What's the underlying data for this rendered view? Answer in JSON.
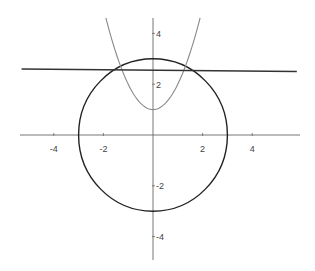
{
  "chart_data": {
    "type": "line",
    "title": "",
    "xlabel": "",
    "ylabel": "",
    "xlim": [
      -6,
      6
    ],
    "ylim": [
      -5,
      5
    ],
    "grid": false,
    "legend": "none",
    "x_ticks": [
      -4,
      -2,
      2,
      4
    ],
    "x_tick_labels": [
      "-4",
      "-2",
      "2",
      "4"
    ],
    "y_ticks": [
      4,
      2,
      -2,
      -4
    ],
    "y_tick_labels": [
      "4",
      "2",
      "-2",
      "-4"
    ],
    "series": [
      {
        "name": "circle",
        "kind": "circle",
        "equation": "x^2 + y^2 = 9",
        "center": [
          0,
          0
        ],
        "radius": 3,
        "color": "#222222"
      },
      {
        "name": "parabola",
        "kind": "function",
        "equation": "y = x^2 + 1",
        "coefficients": {
          "a": 1,
          "b": 0,
          "c": 1
        },
        "x_range": [
          -1.9,
          1.9
        ],
        "color": "#888888"
      },
      {
        "name": "horizontal-line",
        "kind": "line",
        "equation": "y = 2.55",
        "points": [
          [
            -5.3,
            2.6
          ],
          [
            5.8,
            2.5
          ]
        ],
        "color": "#333333"
      }
    ],
    "axis_color": "#666666"
  }
}
